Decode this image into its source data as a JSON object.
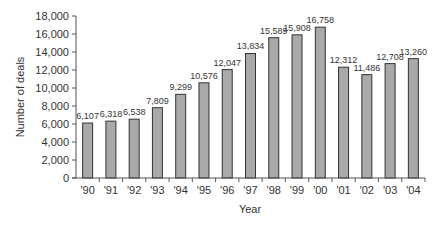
{
  "chart_data": {
    "type": "bar",
    "title": "",
    "xlabel": "Year",
    "ylabel": "Number of deals",
    "ylim": [
      0,
      18000
    ],
    "yticks": [
      0,
      2000,
      4000,
      6000,
      8000,
      10000,
      12000,
      14000,
      16000,
      18000
    ],
    "ytick_labels": [
      "0",
      "2,000",
      "4,000",
      "6,000",
      "8,000",
      "10,000",
      "12,000",
      "14,000",
      "16,000",
      "18,000"
    ],
    "categories": [
      "'90",
      "'91",
      "'92",
      "'93",
      "'94",
      "'95",
      "'96",
      "'97",
      "'98",
      "'99",
      "'00",
      "'01",
      "'02",
      "'03",
      "'04"
    ],
    "values": [
      6107,
      6318,
      6538,
      7809,
      9299,
      10576,
      12047,
      13834,
      15589,
      15908,
      16758,
      12312,
      11486,
      12708,
      13260
    ],
    "value_labels": [
      "6,107",
      "6,318",
      "6,538",
      "7,809",
      "9,299",
      "10,576",
      "12,047",
      "13,834",
      "15,589",
      "15,908",
      "16,758",
      "12,312",
      "11,486",
      "12,708",
      "13,260"
    ],
    "grid": false,
    "legend": null
  },
  "colors": {
    "bar_fill": "#a9a9a9",
    "bar_stroke": "#333333",
    "axis": "#555555",
    "text": "#333333"
  }
}
